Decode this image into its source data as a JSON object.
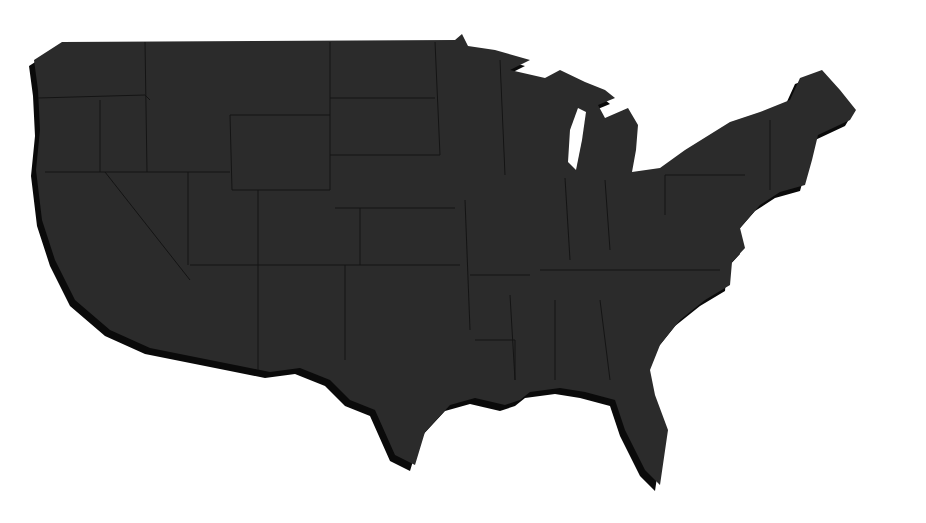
{
  "map": {
    "subject": "Contiguous United States",
    "style": "dark textured silhouette with state borders and drop shadow",
    "colors": {
      "background": "#ffffff",
      "land": "#2b2b2b",
      "shadow": "#0a0a0a",
      "borders": "#141414"
    },
    "labels": []
  }
}
